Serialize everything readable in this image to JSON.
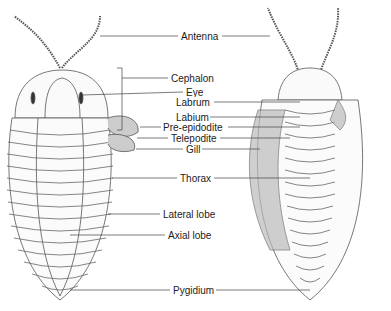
{
  "diagram": {
    "views": [
      "dorsal",
      "ventral"
    ],
    "labels": [
      {
        "id": "antenna",
        "text": "Antenna",
        "x": 180,
        "y": 31
      },
      {
        "id": "cephalon",
        "text": "Cephalon",
        "x": 170,
        "y": 73
      },
      {
        "id": "eye",
        "text": "Eye",
        "x": 185,
        "y": 88
      },
      {
        "id": "labrum",
        "text": "Labrum",
        "x": 175,
        "y": 98
      },
      {
        "id": "labium",
        "text": "Labium",
        "x": 175,
        "y": 113
      },
      {
        "id": "pre-epidodite",
        "text": "Pre-epidodite",
        "x": 163,
        "y": 123
      },
      {
        "id": "telepodite",
        "text": "Telepodite",
        "x": 170,
        "y": 134
      },
      {
        "id": "gill",
        "text": "Gill",
        "x": 185,
        "y": 145
      },
      {
        "id": "thorax",
        "text": "Thorax",
        "x": 179,
        "y": 173
      },
      {
        "id": "lateral-lobe",
        "text": "Lateral lobe",
        "x": 162,
        "y": 209
      },
      {
        "id": "axial-lobe",
        "text": "Axial lobe",
        "x": 167,
        "y": 230
      },
      {
        "id": "pygidium",
        "text": "Pygidium",
        "x": 172,
        "y": 285
      }
    ]
  }
}
